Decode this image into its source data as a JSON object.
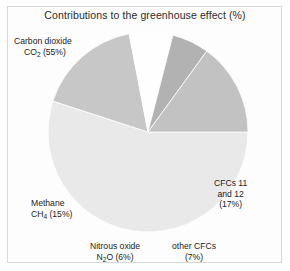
{
  "chart_data": {
    "type": "pie",
    "title": "Contributions to the greenhouse effect (%)",
    "xlabel": "",
    "ylabel": "",
    "legend_position": "none",
    "grid": false,
    "start_angle_deg": 0,
    "direction": "clockwise",
    "categories": [
      "Carbon dioxide CO2",
      "CFCs 11 and 12",
      "other CFCs",
      "Nitrous oxide N2O",
      "Methane CH4"
    ],
    "values": [
      55,
      17,
      7,
      6,
      15
    ],
    "slices": [
      {
        "name": "Carbon dioxide CO2",
        "value": 55,
        "color": "#e9e9e9"
      },
      {
        "name": "CFCs 11 and 12",
        "value": 17,
        "color": "#c7c7c7"
      },
      {
        "name": "other CFCs",
        "value": 7,
        "color": "#fefefe"
      },
      {
        "name": "Nitrous oxide N2O",
        "value": 6,
        "color": "#b2b2b2"
      },
      {
        "name": "Methane CH4",
        "value": 15,
        "color": "#c2c2c2"
      }
    ]
  },
  "figure": {
    "title": "Contributions to the greenhouse effect (%)",
    "border_color": "#d8d8d8",
    "background_color": "#fdfdfd"
  },
  "labels": {
    "carbon_dioxide": {
      "line1": "Carbon dioxide",
      "line2_pre": "CO",
      "line2_sub": "2",
      "line2_post": " (55%)"
    },
    "cfcs_11_12": {
      "line1": "CFCs 11",
      "line2": "and 12",
      "line3": "(17%)"
    },
    "methane": {
      "line1": "Methane",
      "line2_pre": "CH",
      "line2_sub": "4",
      "line2_post": " (15%)"
    },
    "nitrous_oxide": {
      "line1": "Nitrous oxide",
      "line2_pre": "N",
      "line2_sub": "2",
      "line2_post": "O (6%)"
    },
    "other_cfcs": {
      "line1": "other CFCs",
      "line2": "(7%)"
    }
  }
}
